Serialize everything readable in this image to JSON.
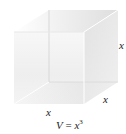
{
  "diagram": {
    "type": "cube",
    "labels": {
      "edge_right_vertical": "x",
      "edge_depth": "x",
      "edge_front_bottom": "x"
    },
    "formula": {
      "lhs": "V",
      "eq": " = ",
      "var": "x",
      "exponent": "3"
    },
    "colors": {
      "front_face": "#f2f2f2",
      "top_face": "#e6e6e6",
      "right_face": "#dcdcdc",
      "edges": "#cfcfcf",
      "text": "#222222"
    }
  }
}
